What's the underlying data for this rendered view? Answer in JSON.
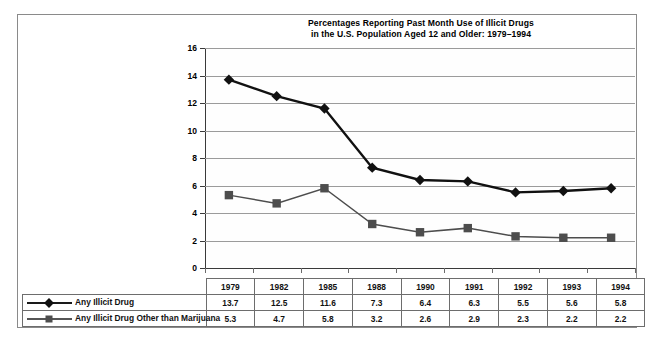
{
  "chart_data": {
    "type": "line",
    "title_line1": "Percentages Reporting Past Month Use of Illicit Drugs",
    "title_line2": "in the U.S. Population Aged 12 and Older: 1979–1994",
    "xlabel": "",
    "ylabel": "",
    "ylim": [
      0,
      16
    ],
    "ytick_step": 2,
    "yticks": [
      "0",
      "2",
      "4",
      "6",
      "8",
      "10",
      "12",
      "14",
      "16"
    ],
    "grid": true,
    "legend_position": "bottom-table",
    "categories": [
      "1979",
      "1982",
      "1985",
      "1988",
      "1990",
      "1991",
      "1992",
      "1993",
      "1994"
    ],
    "series": [
      {
        "name": "Any Illicit Drug",
        "marker": "diamond",
        "color": "#111111",
        "values": [
          13.7,
          12.5,
          11.6,
          7.3,
          6.4,
          6.3,
          5.5,
          5.6,
          5.8
        ]
      },
      {
        "name": "Any Illicit Drug Other than Marijuana",
        "marker": "square",
        "color": "#4d4d4d",
        "values": [
          5.3,
          4.7,
          5.8,
          3.2,
          2.6,
          2.9,
          2.3,
          2.2,
          2.2
        ]
      }
    ]
  },
  "table": {
    "header_blank_label": "",
    "year_headers": [
      "1979",
      "1982",
      "1985",
      "1988",
      "1990",
      "1991",
      "1992",
      "1993",
      "1994"
    ],
    "rows": [
      {
        "label": "Any Illicit Drug",
        "marker": "diamond-marker",
        "values": [
          "13.7",
          "12.5",
          "11.6",
          "7.3",
          "6.4",
          "6.3",
          "5.5",
          "5.6",
          "5.8"
        ]
      },
      {
        "label": "Any Illicit Drug Other than Marijuana",
        "marker": "square-marker",
        "values": [
          "5.3",
          "4.7",
          "5.8",
          "3.2",
          "2.6",
          "2.9",
          "2.3",
          "2.2",
          "2.2"
        ]
      }
    ]
  },
  "colors": {
    "series1": "#111111",
    "series2": "#4d4d4d",
    "gridline": "#9b9b9b",
    "axis": "#3a3a3a",
    "frame": "#8a8a8a",
    "table_border": "#6d6d6d"
  }
}
